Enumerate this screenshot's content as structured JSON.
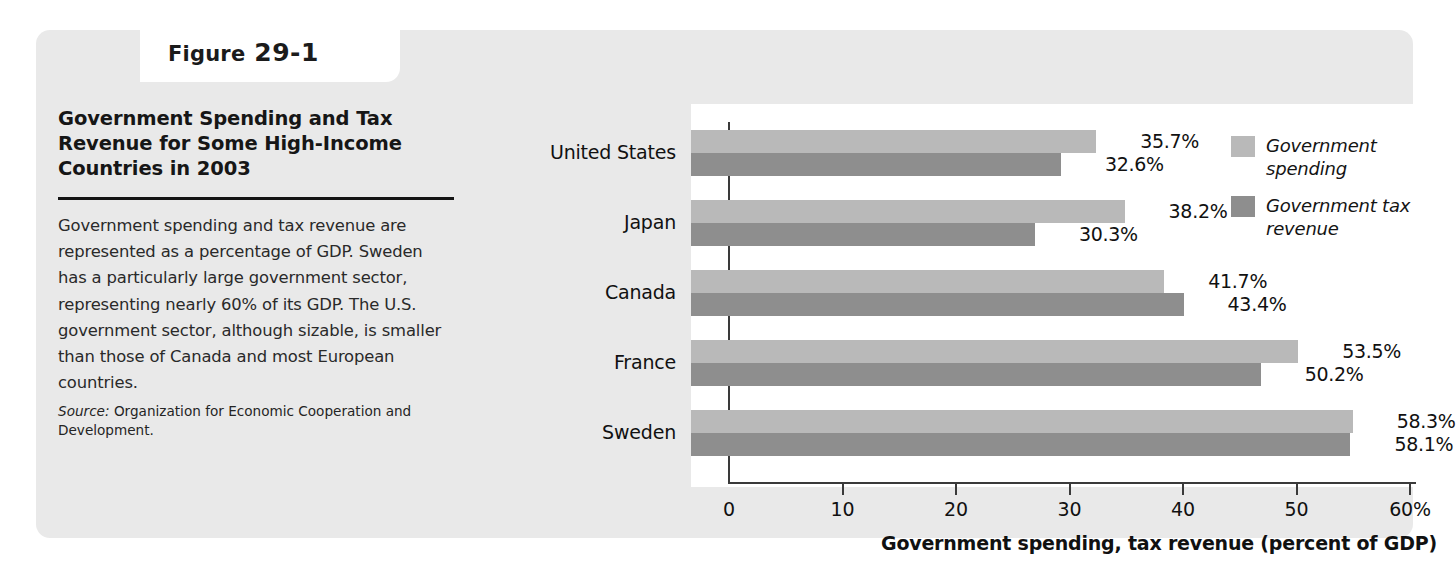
{
  "figure": {
    "tab_word": "Figure",
    "tab_number": "29-1",
    "title": "Government Spending and Tax Revenue for Some High-Income Countries in 2003",
    "caption": "Government spending and tax revenue are represented as a percentage of GDP. Sweden has a particularly large government sector, representing nearly 60% of its GDP. The U.S. government sector, although sizable, is smaller than those of Canada and most European countries.",
    "source_label": "Source:",
    "source_text": "Organization for Economic Cooperation and Development."
  },
  "chart_data": {
    "type": "bar",
    "orientation": "horizontal",
    "title": "Government Spending and Tax Revenue for Some High-Income Countries in 2003",
    "xlabel": "Government spending, tax revenue (percent of GDP)",
    "ylabel": "",
    "xlim": [
      0,
      60
    ],
    "xticks": [
      0,
      10,
      20,
      30,
      40,
      50,
      60
    ],
    "xtick_labels": [
      "0",
      "10",
      "20",
      "30",
      "40",
      "50",
      "60%"
    ],
    "grid": false,
    "legend_position": "top-right",
    "categories": [
      "United States",
      "Japan",
      "Canada",
      "France",
      "Sweden"
    ],
    "series": [
      {
        "name": "Government spending",
        "color": "#b9b9b9",
        "values": [
          35.7,
          38.2,
          41.7,
          53.5,
          58.3
        ],
        "labels": [
          "35.7%",
          "38.2%",
          "41.7%",
          "53.5%",
          "58.3%"
        ]
      },
      {
        "name": "Government tax revenue",
        "color": "#8e8e8e",
        "values": [
          32.6,
          30.3,
          43.4,
          50.2,
          58.1
        ],
        "labels": [
          "32.6%",
          "30.3%",
          "43.4%",
          "50.2%",
          "58.1%"
        ]
      }
    ]
  }
}
